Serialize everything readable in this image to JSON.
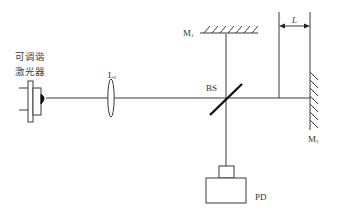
{
  "diagram": {
    "type": "michelson-interferometer-setup",
    "laser": {
      "label_line1": "可调谐",
      "label_line2": "激光器"
    },
    "lens": {
      "label": "L",
      "subscript": "0"
    },
    "beam_splitter": {
      "label": "BS"
    },
    "mirror1": {
      "label": "M",
      "subscript": "1"
    },
    "mirror2": {
      "label": "M",
      "subscript": "2"
    },
    "detector": {
      "label": "PD"
    },
    "distance": {
      "label": "L"
    },
    "colors": {
      "line": "#3a3a3a",
      "bs": "#111111",
      "background": "#ffffff"
    }
  }
}
